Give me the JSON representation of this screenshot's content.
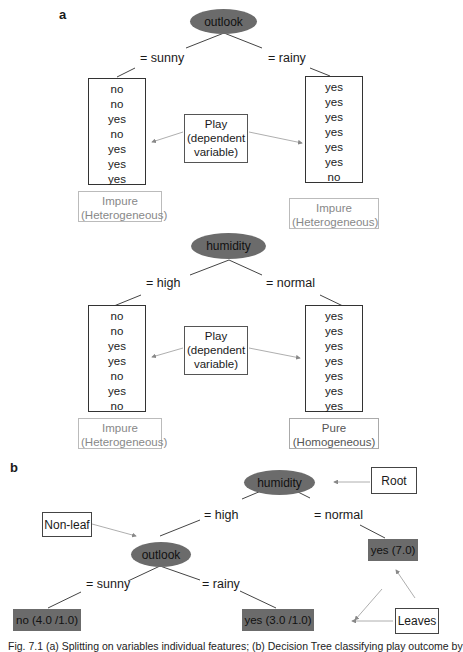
{
  "panel_a": {
    "label": "a",
    "tree1": {
      "root": "outlook",
      "left_branch": "=  sunny",
      "right_branch": "=  rainy",
      "left_values": [
        "no",
        "no",
        "yes",
        "no",
        "yes",
        "yes",
        "yes"
      ],
      "right_values": [
        "yes",
        "yes",
        "yes",
        "yes",
        "yes",
        "yes",
        "no"
      ],
      "play_label": [
        "Play",
        "(dependent",
        "variable)"
      ],
      "left_purity": [
        "Impure",
        "(Heterogeneous)"
      ],
      "right_purity": [
        "Impure",
        "(Heterogeneous)"
      ]
    },
    "tree2": {
      "root": "humidity",
      "left_branch": "=  high",
      "right_branch": "=  normal",
      "left_values": [
        "no",
        "no",
        "yes",
        "yes",
        "no",
        "yes",
        "no"
      ],
      "right_values": [
        "yes",
        "yes",
        "yes",
        "yes",
        "yes",
        "yes",
        "yes"
      ],
      "play_label": [
        "Play",
        "(dependent",
        "variable)"
      ],
      "left_purity": [
        "Impure",
        "(Heterogeneous)"
      ],
      "right_purity": [
        "Pure",
        "(Homogeneous)"
      ]
    }
  },
  "panel_b": {
    "label": "b",
    "root": "humidity",
    "root_callout": "Root",
    "branch_high": "=  high",
    "branch_normal": "=  normal",
    "nonleaf_callout": "Non-leaf",
    "inner_node": "outlook",
    "branch_sunny": "=  sunny",
    "branch_rainy": "=  rainy",
    "leaf_normal": "yes (7.0)",
    "leaf_sunny": "no (4.0 /1.0)",
    "leaf_rainy": "yes (3.0 /1.0)",
    "leaves_callout": "Leaves"
  },
  "caption": "Fig. 7.1  (a) Splitting on variables individual features; (b) Decision Tree classifying play outcome by"
}
